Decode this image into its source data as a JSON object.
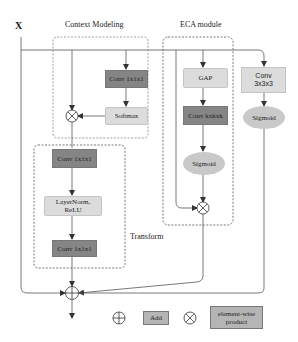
{
  "input": {
    "label": "X"
  },
  "context_modeling": {
    "title": "Context Modeling",
    "conv": "Conv 1x1x1",
    "softmax": "Softmax"
  },
  "transform": {
    "title": "Transform",
    "conv_top": "Conv 1x1x1",
    "norm": "LayerNorm,\nReLU",
    "norm_line1": "LayerNorm,",
    "norm_line2": "ReLU",
    "conv_bottom": "Conv 1x1x1"
  },
  "eca": {
    "title": "ECA module",
    "gap": "GAP",
    "conv": "Conv kxkxk",
    "sigmoid": "Sigmoid"
  },
  "side_branch": {
    "conv_line1": "Conv",
    "conv_line2": "3x3x3",
    "sigmoid": "Sigmoid"
  },
  "legend": {
    "add_symbol": "⊕",
    "add_label": "Add",
    "product_symbol": "⊗",
    "product_line1": "element-wise",
    "product_line2": "product"
  },
  "colors": {
    "dark_box": "#858585",
    "light_box": "#dcdcdc",
    "ellipse": "#c9c9c9",
    "line": "#555555",
    "dashed": "#777777"
  }
}
